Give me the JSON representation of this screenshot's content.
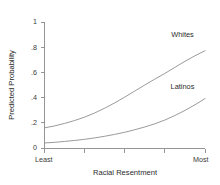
{
  "chart_data": {
    "type": "line",
    "title": "",
    "xlabel": "Racial Resentment",
    "ylabel": "Predicted Probability",
    "xlim": [
      0,
      1
    ],
    "ylim": [
      0,
      1
    ],
    "grid": false,
    "legend_position": "inline-curve-labels",
    "y_ticks": [
      0,
      0.2,
      0.4,
      0.6,
      0.8,
      1
    ],
    "y_tick_labels": [
      "0",
      ".2",
      ".4",
      ".6",
      ".8",
      "1"
    ],
    "x_ticks": [
      0,
      0.25,
      0.5,
      0.75,
      1
    ],
    "x_tick_labels": [
      "Least",
      "",
      "",
      "",
      "Most"
    ],
    "x_endpoint_labels": {
      "left": "Least",
      "right": "Most"
    },
    "x": [
      0,
      0.0625,
      0.125,
      0.1875,
      0.25,
      0.3125,
      0.375,
      0.4375,
      0.5,
      0.5625,
      0.625,
      0.6875,
      0.75,
      0.8125,
      0.875,
      0.9375,
      1
    ],
    "series": [
      {
        "name": "Whites",
        "label": "Whites",
        "color": "#8e8e8e",
        "values": [
          0.16,
          0.175,
          0.195,
          0.218,
          0.245,
          0.278,
          0.316,
          0.358,
          0.404,
          0.452,
          0.5,
          0.547,
          0.592,
          0.64,
          0.688,
          0.732,
          0.772
        ]
      },
      {
        "name": "Latinos",
        "label": "Latinos",
        "color": "#8e8e8e",
        "values": [
          0.04,
          0.045,
          0.052,
          0.06,
          0.069,
          0.08,
          0.093,
          0.108,
          0.125,
          0.145,
          0.167,
          0.192,
          0.222,
          0.258,
          0.298,
          0.343,
          0.392
        ]
      }
    ],
    "annotations": [
      {
        "text": "Whites",
        "x": 0.86,
        "y": 0.88
      },
      {
        "text": "Latinos",
        "x": 0.86,
        "y": 0.47
      }
    ]
  }
}
